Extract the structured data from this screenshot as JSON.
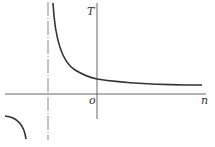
{
  "diagram": {
    "type": "function-graph",
    "labels": {
      "y_axis": "T",
      "x_axis": "n",
      "origin": "o"
    },
    "colors": {
      "curve": "#333333",
      "axis": "#555555",
      "asymptote": "#777777",
      "background": "#ffffff"
    }
  }
}
